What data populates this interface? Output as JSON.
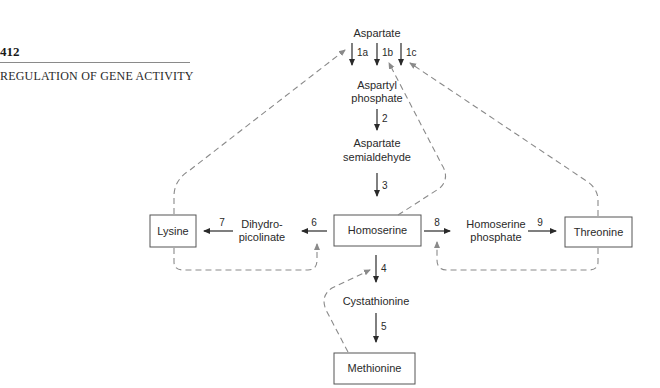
{
  "header": {
    "page_number": "412",
    "running_head": "REGULATION OF GENE ACTIVITY"
  },
  "diagram": {
    "nodes": {
      "aspartate": "Aspartate",
      "aspartyl_phosphate_1": "Aspartyl",
      "aspartyl_phosphate_2": "phosphate",
      "aspartate_semialdehyde_1": "Aspartate",
      "aspartate_semialdehyde_2": "semialdehyde",
      "homoserine": "Homoserine",
      "dihydropicolinate_1": "Dihydro-",
      "dihydropicolinate_2": "picolinate",
      "lysine": "Lysine",
      "homoserine_phosphate_1": "Homoserine",
      "homoserine_phosphate_2": "phosphate",
      "threonine": "Threonine",
      "cystathionine": "Cystathionine",
      "methionine": "Methionine"
    },
    "steps": {
      "s1a": "1a",
      "s1b": "1b",
      "s1c": "1c",
      "s2": "2",
      "s3": "3",
      "s4": "4",
      "s5": "5",
      "s6": "6",
      "s7": "7",
      "s8": "8",
      "s9": "9"
    },
    "feedback": [
      {
        "from": "Lysine",
        "to": "1a"
      },
      {
        "from": "Homoserine",
        "to": "1b"
      },
      {
        "from": "Threonine",
        "to": "1c"
      },
      {
        "from": "Lysine",
        "to": "6"
      },
      {
        "from": "Threonine",
        "to": "8"
      },
      {
        "from": "Methionine",
        "to": "4"
      }
    ],
    "colors": {
      "solid_arrow": "#2a2a2a",
      "dashed_feedback": "#8a8a8a",
      "box_border": "#555555"
    }
  }
}
